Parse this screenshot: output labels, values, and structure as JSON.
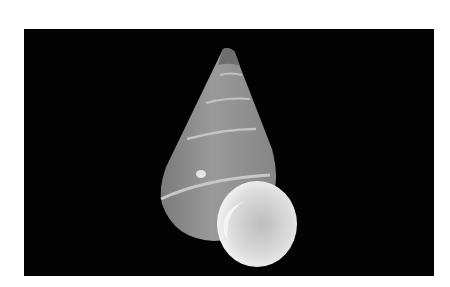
{
  "image": {
    "subject": "conical snail shell with spiral bands",
    "background_color": "#030303",
    "shell_color": "#8e8e8e",
    "aperture_color": "#d8d8d8",
    "band_color": "#c4c4c4"
  }
}
